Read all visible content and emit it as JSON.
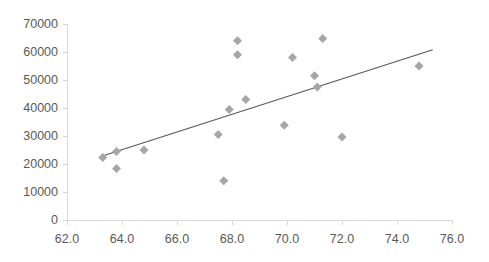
{
  "chart_data": {
    "type": "scatter",
    "title": "",
    "subtitle": "",
    "xlabel": "",
    "ylabel": "",
    "xlim": [
      62.0,
      76.0
    ],
    "ylim": [
      0,
      70000
    ],
    "xticks": [
      "62.0",
      "64.0",
      "66.0",
      "68.0",
      "70.0",
      "72.0",
      "74.0",
      "76.0"
    ],
    "xtick_values": [
      62.0,
      64.0,
      66.0,
      68.0,
      70.0,
      72.0,
      74.0,
      76.0
    ],
    "yticks": [
      "0",
      "10000",
      "20000",
      "30000",
      "40000",
      "50000",
      "60000",
      "70000"
    ],
    "ytick_values": [
      0,
      10000,
      20000,
      30000,
      40000,
      50000,
      60000,
      70000
    ],
    "grid": false,
    "legend": false,
    "legend_position": "none",
    "marker": "diamond",
    "marker_color": "#a6a6a6",
    "marker_size": 9,
    "axis_color": "#d9d9d9",
    "trendline_color": "#595959",
    "series": [
      {
        "name": "series1",
        "x": [
          63.3,
          63.8,
          63.8,
          64.8,
          67.5,
          67.7,
          67.9,
          68.2,
          68.2,
          68.5,
          69.9,
          70.2,
          71.0,
          71.1,
          71.3,
          72.0,
          74.8
        ],
        "y": [
          22300,
          24500,
          18400,
          25000,
          30500,
          14000,
          39500,
          64000,
          59000,
          43000,
          33800,
          58000,
          51500,
          47500,
          64800,
          29600,
          55000
        ]
      }
    ],
    "trendline": {
      "type": "linear",
      "x_start": 63.2,
      "y_start": 22600,
      "x_end": 75.3,
      "y_end": 60800
    }
  }
}
